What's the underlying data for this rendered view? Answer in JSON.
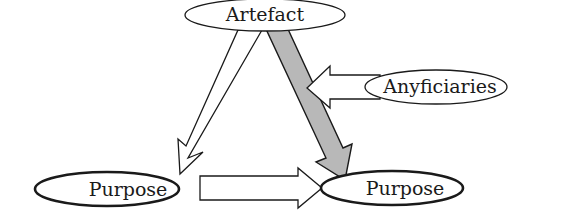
{
  "diagram": {
    "nodes": {
      "artefact": {
        "label": "Artefact"
      },
      "anyficiaries": {
        "label": "Anyficiaries"
      },
      "purpose_left": {
        "label": "Purpose"
      },
      "purpose_right": {
        "label": "Purpose"
      }
    },
    "edges": [
      {
        "from": "artefact",
        "to": "purpose_left",
        "style": "outline"
      },
      {
        "from": "artefact",
        "to": "purpose_right",
        "style": "filled",
        "fill": "#b8b8b8"
      },
      {
        "from": "purpose_left",
        "to": "purpose_right",
        "style": "outline"
      },
      {
        "from": "anyficiaries",
        "to": "artefact-purpose_right-edge",
        "style": "outline"
      }
    ],
    "colors": {
      "stroke": "#1a1a1a",
      "gray_arrow_fill": "#b8b8b8",
      "background": "#ffffff"
    }
  }
}
